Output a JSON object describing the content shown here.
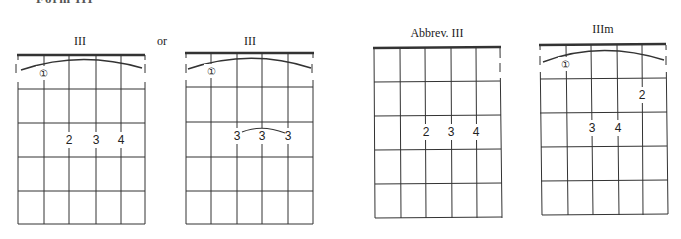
{
  "page": {
    "header_clipped": "Form III",
    "connector_word": "or"
  },
  "diagrams": [
    {
      "title": "III",
      "barre": true,
      "barre_finger": "1",
      "fingers": [
        {
          "string": 3,
          "fret": 3,
          "label": "2"
        },
        {
          "string": 4,
          "fret": 3,
          "label": "3"
        },
        {
          "string": 5,
          "fret": 3,
          "label": "4"
        }
      ]
    },
    {
      "title": "III",
      "barre": true,
      "barre_finger": "1",
      "fingers": [
        {
          "string": 3,
          "fret": 3,
          "label": "3"
        },
        {
          "string": 4,
          "fret": 3,
          "label": "3"
        },
        {
          "string": 5,
          "fret": 3,
          "label": "3"
        }
      ],
      "slur_over_fingers": true
    },
    {
      "title": "Abbrev. III",
      "barre": false,
      "edge_marker": "1",
      "fingers": [
        {
          "string": 3,
          "fret": 3,
          "label": "2"
        },
        {
          "string": 4,
          "fret": 3,
          "label": "3"
        },
        {
          "string": 5,
          "fret": 3,
          "label": "4"
        }
      ]
    },
    {
      "title": "IIIm",
      "barre": true,
      "barre_finger": "1",
      "fingers": [
        {
          "string": 5,
          "fret": 2,
          "label": "2"
        },
        {
          "string": 3,
          "fret": 3,
          "label": "3"
        },
        {
          "string": 4,
          "fret": 3,
          "label": "4"
        }
      ]
    }
  ],
  "glyphs": {
    "circled_one": "①"
  }
}
